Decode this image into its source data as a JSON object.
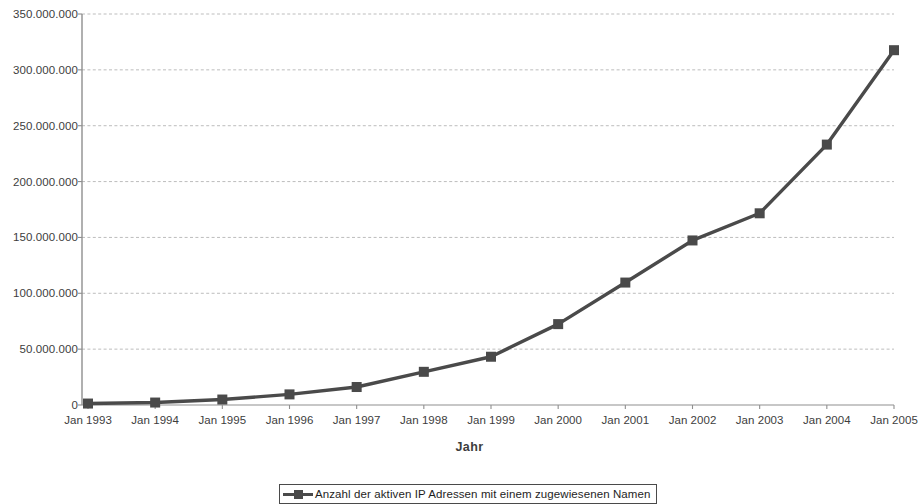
{
  "chart_data": {
    "type": "line",
    "title": "",
    "xlabel": "Jahr",
    "ylabel": "",
    "grid": true,
    "legend_position": "bottom",
    "categories": [
      "Jan 1993",
      "Jan 1994",
      "Jan 1995",
      "Jan 1996",
      "Jan 1997",
      "Jan 1998",
      "Jan 1999",
      "Jan 2000",
      "Jan 2001",
      "Jan 2002",
      "Jan 2003",
      "Jan 2004",
      "Jan 2005"
    ],
    "series": [
      {
        "name": "Anzahl der aktiven IP Adressen mit einem zugewiesenen Namen",
        "marker": "square",
        "color": "#4a4a4a",
        "values": [
          1300000,
          2200000,
          4900000,
          9500000,
          16100000,
          29700000,
          43200000,
          72400000,
          109600000,
          147300000,
          171600000,
          233100000,
          317600000
        ]
      }
    ],
    "ylim": [
      0,
      350000000
    ],
    "ytick_values": [
      0,
      50000000,
      100000000,
      150000000,
      200000000,
      250000000,
      300000000,
      350000000
    ],
    "ytick_labels": [
      "0",
      "50.000.000",
      "100.000.000",
      "150.000.000",
      "200.000.000",
      "250.000.000",
      "300.000.000",
      "350.000.000"
    ]
  },
  "axis": {
    "x_title": "Jahr"
  },
  "legend": {
    "entries": [
      {
        "label": "Anzahl der aktiven IP Adressen mit einem zugewiesenen Namen",
        "marker_icon": "line-square-marker",
        "color": "#4a4a4a"
      }
    ]
  },
  "colors": {
    "series": "#4a4a4a",
    "axis": "#808080",
    "grid": "#b5b5b5",
    "text": "#3d3d3d"
  }
}
